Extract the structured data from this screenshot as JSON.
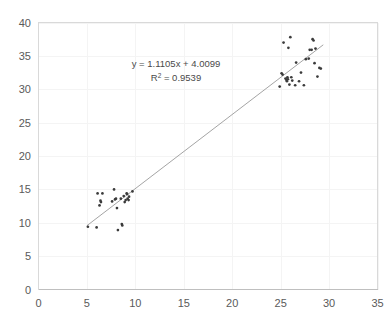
{
  "chart": {
    "title": "",
    "background_color": "#ffffff",
    "marker_color": "#3b3b3b",
    "trendline_color": "#9a9a9a",
    "grid_color": "#f4f4f4",
    "axis_color": "#d9d9d9",
    "label_color": "#5a5a5a",
    "annotation_color": "#4a4a4a"
  },
  "annotations": {
    "equation": "y = 1.1105x + 4.0099",
    "r_squared_prefix": "R",
    "r_squared_sup": "2",
    "r_squared_value": " = 0.9539"
  },
  "chart_data": {
    "type": "scatter",
    "title": "",
    "xlabel": "",
    "ylabel": "",
    "xlim": [
      0,
      35
    ],
    "ylim": [
      0,
      40
    ],
    "xticks": [
      0,
      5,
      10,
      15,
      20,
      25,
      30,
      35
    ],
    "yticks": [
      0,
      5,
      10,
      15,
      20,
      25,
      30,
      35,
      40
    ],
    "grid": true,
    "legend": false,
    "trendline": {
      "type": "linear",
      "slope": 1.1105,
      "intercept": 4.0099,
      "r_squared": 0.9539,
      "equation_label": "y = 1.1105x + 4.0099",
      "r2_label": "R² = 0.9539",
      "x_start": 5.0,
      "x_end": 29.4
    },
    "points": [
      [
        5.1,
        9.4
      ],
      [
        6.0,
        9.3
      ],
      [
        6.1,
        14.4
      ],
      [
        6.3,
        12.6
      ],
      [
        6.4,
        13.3
      ],
      [
        6.45,
        13.1
      ],
      [
        6.6,
        14.4
      ],
      [
        7.6,
        13.2
      ],
      [
        7.8,
        15.0
      ],
      [
        7.9,
        13.5
      ],
      [
        8.0,
        13.6
      ],
      [
        8.1,
        12.2
      ],
      [
        8.2,
        8.9
      ],
      [
        8.5,
        13.6
      ],
      [
        8.6,
        9.8
      ],
      [
        8.65,
        9.6
      ],
      [
        8.8,
        14.0
      ],
      [
        8.9,
        13.1
      ],
      [
        9.0,
        13.4
      ],
      [
        9.1,
        14.4
      ],
      [
        9.15,
        14.3
      ],
      [
        9.2,
        13.6
      ],
      [
        9.3,
        13.4
      ],
      [
        9.35,
        13.9
      ],
      [
        9.7,
        14.7
      ],
      [
        24.9,
        30.4
      ],
      [
        25.1,
        32.4
      ],
      [
        25.2,
        32.2
      ],
      [
        25.3,
        37.0
      ],
      [
        25.5,
        31.6
      ],
      [
        25.6,
        31.4
      ],
      [
        25.65,
        31.2
      ],
      [
        25.7,
        31.8
      ],
      [
        25.75,
        31.5
      ],
      [
        25.8,
        36.2
      ],
      [
        25.9,
        30.7
      ],
      [
        26.0,
        37.8
      ],
      [
        26.1,
        31.8
      ],
      [
        26.2,
        31.3
      ],
      [
        26.5,
        30.6
      ],
      [
        26.6,
        34.0
      ],
      [
        26.9,
        31.2
      ],
      [
        27.1,
        32.5
      ],
      [
        27.4,
        30.6
      ],
      [
        27.6,
        34.5
      ],
      [
        27.9,
        34.6
      ],
      [
        28.0,
        35.9
      ],
      [
        28.2,
        35.9
      ],
      [
        28.3,
        37.5
      ],
      [
        28.4,
        37.3
      ],
      [
        28.5,
        33.9
      ],
      [
        28.6,
        36.1
      ],
      [
        28.8,
        31.9
      ],
      [
        29.0,
        33.2
      ],
      [
        29.15,
        33.1
      ]
    ]
  }
}
